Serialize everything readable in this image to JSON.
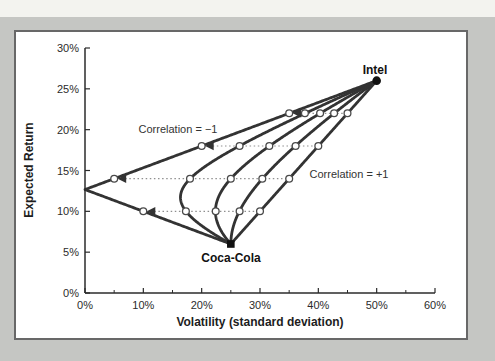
{
  "window": {
    "background_color": "#c5c6c3",
    "top_strip_color": "#f3f3ef",
    "card_background": "#ffffff",
    "card_border_color": "#686868"
  },
  "chart_data": {
    "type": "line",
    "title": "",
    "xlabel": "Volatility (standard deviation)",
    "ylabel": "Expected Return",
    "xlim_pct": [
      0,
      60
    ],
    "ylim_pct": [
      0,
      30
    ],
    "grid": false,
    "curve_color": "#333333",
    "dotted_color": "#8f8f8f",
    "marker_stroke": "#4a4a4a",
    "x_ticks": [
      {
        "pct": 0,
        "label": "0%"
      },
      {
        "pct": 10,
        "label": "10%"
      },
      {
        "pct": 20,
        "label": "20%"
      },
      {
        "pct": 30,
        "label": "30%"
      },
      {
        "pct": 40,
        "label": "40%"
      },
      {
        "pct": 50,
        "label": "50%"
      },
      {
        "pct": 60,
        "label": "60%"
      }
    ],
    "x_minor_ticks_pct": [
      5,
      15,
      25,
      35,
      45,
      55
    ],
    "y_ticks": [
      {
        "pct": 0,
        "label": "0%"
      },
      {
        "pct": 5,
        "label": "5%"
      },
      {
        "pct": 10,
        "label": "10%"
      },
      {
        "pct": 15,
        "label": "15%"
      },
      {
        "pct": 20,
        "label": "20%"
      },
      {
        "pct": 25,
        "label": "25%"
      },
      {
        "pct": 30,
        "label": "30%"
      }
    ],
    "assets": [
      {
        "name": "Intel",
        "expected_return_pct": 26,
        "volatility_pct": 50
      },
      {
        "name": "Coca-Cola",
        "expected_return_pct": 6,
        "volatility_pct": 25
      }
    ],
    "marker_intel_weights": [
      0.2,
      0.4,
      0.6,
      0.8
    ],
    "marker_expected_returns_pct": [
      10,
      14,
      18,
      22
    ],
    "series": [
      {
        "name": "Correlation = −1",
        "correlation": -1,
        "marker_volatilities_pct": [
          10,
          5,
          20,
          35
        ]
      },
      {
        "name": "Correlation = −0.5",
        "correlation": -0.5,
        "marker_volatilities_pct": [
          17.3,
          18.0,
          26.5,
          37.7
        ]
      },
      {
        "name": "Correlation = 0",
        "correlation": 0,
        "marker_volatilities_pct": [
          22.4,
          25.0,
          31.6,
          40.3
        ]
      },
      {
        "name": "Correlation = +0.5",
        "correlation": 0.5,
        "marker_volatilities_pct": [
          26.5,
          30.4,
          36.1,
          42.7
        ]
      },
      {
        "name": "Correlation = +1",
        "correlation": 1,
        "marker_volatilities_pct": [
          30,
          35,
          40,
          45
        ]
      }
    ],
    "annotations": [
      {
        "text": "Correlation = −1"
      },
      {
        "text": "Correlation = +1"
      }
    ],
    "legend": "none"
  }
}
